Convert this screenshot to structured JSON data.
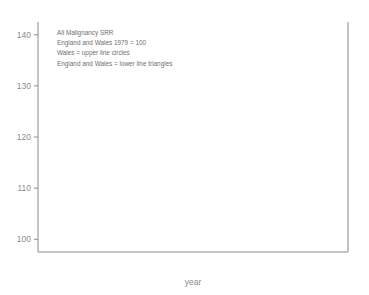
{
  "chart_data": {
    "type": "line",
    "title": "",
    "xlabel": "year",
    "ylabel": "",
    "xlim": [
      73.4,
      92.2
    ],
    "ylim": [
      97.5,
      142.5
    ],
    "xticks": [
      75,
      80,
      85,
      90
    ],
    "yticks": [
      100,
      110,
      120,
      130,
      140
    ],
    "xticklabels": [
      "75",
      "80",
      "85",
      "90"
    ],
    "yticklabels": [
      "100",
      "110",
      "120",
      "130",
      "140"
    ],
    "grid": false,
    "legend_position": "none",
    "annotations": [
      "All Malignancy SRR",
      "England and Wales 1979 = 100",
      "Wales = upper line circles",
      "England and Wales = lower line triangles"
    ],
    "x": [
      1974,
      1975,
      1976,
      1977,
      1978,
      1979,
      1980,
      1981,
      1982,
      1983,
      1984,
      1985,
      1986,
      1987,
      1988,
      1989
    ],
    "series": [
      {
        "name": "Wales",
        "marker": "circle",
        "values": [
          104.6,
          107.5,
          105.3,
          106.5,
          110.8,
          111.7,
          112.3,
          112.4,
          113.2,
          117.6,
          122.8,
          126.6,
          128.5,
          125.2,
          133.8,
          137.8
        ]
      },
      {
        "name": "England and Wales",
        "marker": "triangle",
        "values": [
          100.4,
          100.8,
          101.0,
          102.0,
          100.7,
          100.0,
          100.6,
          101.2,
          102.0,
          102.1,
          102.7,
          103.2,
          101.0,
          101.6,
          106.8,
          118.5
        ]
      }
    ],
    "series_extra": [
      {
        "name": "Wales",
        "x": [
          1990
        ],
        "values": [
          132.6
        ]
      },
      {
        "name": "England and Wales",
        "x": [
          1989,
          1990,
          1991
        ],
        "values": [
          116.6,
          117.2,
          118.7
        ]
      }
    ],
    "colors": {
      "axis": "#8a8a8a",
      "line": "#8a8a8a",
      "marker_fill": "#ffffff",
      "marker_stroke": "#7d7d7d",
      "text": "#8d8d8d",
      "annotation_text": "#6f6f6f",
      "background": "#ffffff"
    }
  }
}
